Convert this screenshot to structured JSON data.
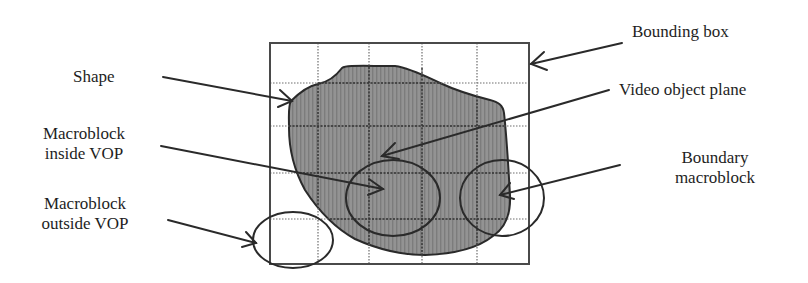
{
  "diagram": {
    "title": "",
    "labels": {
      "bounding_box": "Bounding box",
      "shape": "Shape",
      "video_object_plane": "Video object plane",
      "macroblock_inside": {
        "line1": "Macroblock",
        "line2": "inside VOP"
      },
      "boundary_macroblock": {
        "line1": "Boundary",
        "line2": "macroblock"
      },
      "macroblock_outside": {
        "line1": "Macroblock",
        "line2": "outside VOP"
      }
    },
    "colors": {
      "ink": "#1e1e1e",
      "grid": "#7a7a7a",
      "box": "#4a4a4a",
      "shape_fill": "#8c8c8c",
      "background": "#ffffff"
    },
    "bounding_box": {
      "x": 270,
      "y": 43,
      "width": 259,
      "height": 221
    },
    "grid": {
      "vertical_lines_x": [
        318,
        369,
        422,
        477
      ],
      "horizontal_lines_y": [
        83,
        126,
        173,
        219
      ]
    },
    "ellipses": [
      {
        "name": "macroblock-inside-vop",
        "cx": 393,
        "cy": 198,
        "rx": 47,
        "ry": 38
      },
      {
        "name": "boundary-macroblock",
        "cx": 502,
        "cy": 198,
        "rx": 42,
        "ry": 38
      },
      {
        "name": "macroblock-outside-vop",
        "cx": 293,
        "cy": 240,
        "rx": 40,
        "ry": 28
      }
    ],
    "arrows": [
      {
        "name": "bounding-box-arrow",
        "from": [
          622,
          43
        ],
        "to": [
          531,
          64
        ]
      },
      {
        "name": "shape-arrow",
        "from": [
          163,
          77
        ],
        "to": [
          292,
          101
        ]
      },
      {
        "name": "video-object-plane-arrow",
        "from": [
          609,
          90
        ],
        "to": [
          382,
          156
        ]
      },
      {
        "name": "macroblock-inside-arrow",
        "from": [
          161,
          146
        ],
        "to": [
          383,
          189
        ]
      },
      {
        "name": "boundary-macroblock-arrow",
        "from": [
          620,
          165
        ],
        "to": [
          500,
          195
        ]
      },
      {
        "name": "macroblock-outside-arrow",
        "from": [
          168,
          220
        ],
        "to": [
          256,
          243
        ]
      }
    ]
  }
}
